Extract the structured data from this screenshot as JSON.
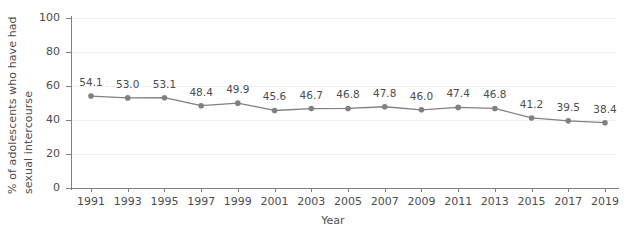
{
  "chart_data": {
    "type": "line",
    "title": "",
    "xlabel": "Year",
    "ylabel": "% of adolescents who have had sexual intercourse",
    "ylabel_lines": [
      "% of adolescents who have had",
      "sexual intercourse"
    ],
    "categories": [
      "1991",
      "1993",
      "1995",
      "1997",
      "1999",
      "2001",
      "2003",
      "2005",
      "2007",
      "2009",
      "2011",
      "2013",
      "2015",
      "2017",
      "2019"
    ],
    "values": [
      54.1,
      53.0,
      53.1,
      48.4,
      49.9,
      45.6,
      46.7,
      46.8,
      47.8,
      46.0,
      47.4,
      46.8,
      41.2,
      39.5,
      38.4
    ],
    "value_labels": [
      "54.1",
      "53.0",
      "53.1",
      "48.4",
      "49.9",
      "45.6",
      "46.7",
      "46.8",
      "47.8",
      "46.0",
      "47.4",
      "46.8",
      "41.2",
      "39.5",
      "38.4"
    ],
    "ylim": [
      0,
      100
    ],
    "yticks": [
      0,
      20,
      40,
      60,
      80,
      100
    ],
    "ytick_labels": [
      "0",
      "20",
      "40",
      "60",
      "80",
      "100"
    ],
    "grid": true,
    "legend": "none",
    "series_color": "#808080",
    "marker": "circle",
    "marker_color": "#808080",
    "text_color": "#4d4d4d",
    "grid_color": "#f2f2f2",
    "axis_color": "#808080",
    "background": "#ffffff"
  }
}
